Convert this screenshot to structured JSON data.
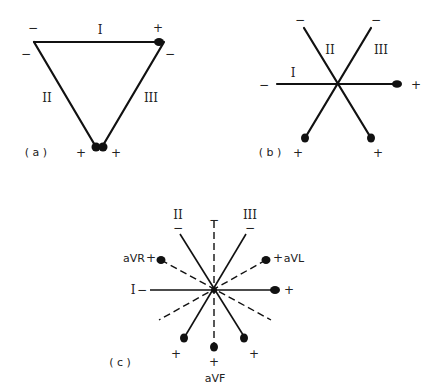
{
  "panels": {
    "a": {
      "caption": "( a )",
      "leads": {
        "I": {
          "label": "I",
          "neg": "−",
          "pos": "+"
        },
        "II": {
          "label": "II",
          "neg": "−",
          "pos": "+"
        },
        "III": {
          "label": "III",
          "neg": "−",
          "pos": "+"
        }
      }
    },
    "b": {
      "caption": "( b )",
      "leads": {
        "I": {
          "label": "I",
          "neg": "−",
          "pos": "+"
        },
        "II": {
          "label": "II",
          "neg": "−",
          "pos": "+"
        },
        "III": {
          "label": "III",
          "neg": "−",
          "pos": "+"
        }
      }
    },
    "c": {
      "caption": "( c )",
      "leads": {
        "I": {
          "label": "I",
          "neg": "−",
          "pos": "+"
        },
        "II": {
          "label": "II",
          "neg": "−",
          "pos": "+"
        },
        "III": {
          "label": "III",
          "neg": "−",
          "pos": "+"
        },
        "aVR": {
          "label": "aVR",
          "pos": "+"
        },
        "aVL": {
          "label": "aVL",
          "pos": "+"
        },
        "aVF": {
          "label": "aVF",
          "neg": "−",
          "pos": "+"
        }
      }
    }
  }
}
